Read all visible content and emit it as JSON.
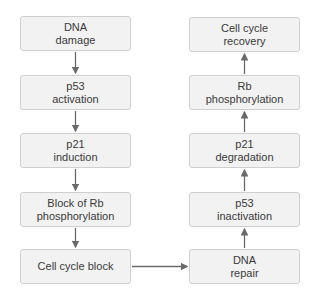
{
  "diagram": {
    "left_column": [
      {
        "label": "DNA\ndamage"
      },
      {
        "label": "p53\nactivation"
      },
      {
        "label": "p21\ninduction"
      },
      {
        "label": "Block of Rb\nphosphorylation"
      },
      {
        "label": "Cell cycle block"
      }
    ],
    "right_column": [
      {
        "label": "Cell cycle\nrecovery"
      },
      {
        "label": "Rb\nphosphorylation"
      },
      {
        "label": "p21\ndegradation"
      },
      {
        "label": "p53\ninactivation"
      },
      {
        "label": "DNA\nrepair"
      }
    ],
    "colors": {
      "box_fill": "#f2f2f2",
      "box_border": "#cfcfcf",
      "arrow": "#6a6a6a",
      "text": "#3a3a3a"
    }
  }
}
